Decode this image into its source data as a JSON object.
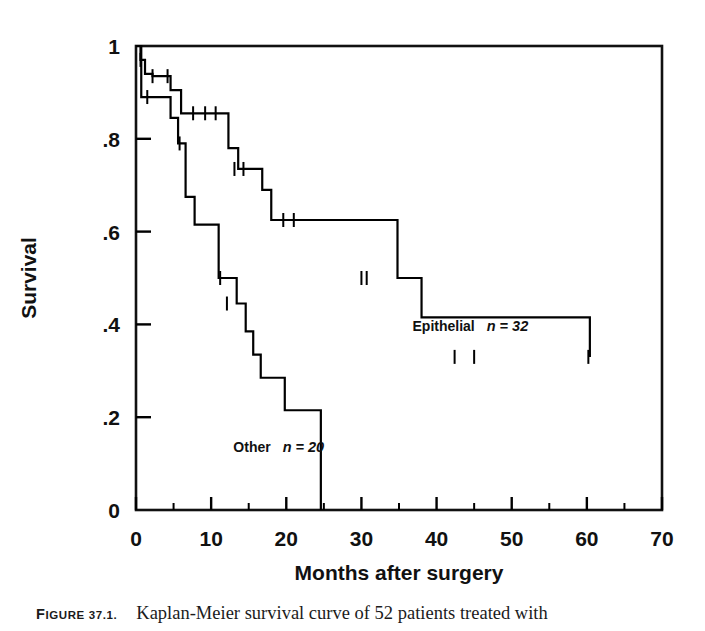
{
  "figure": {
    "caption_label": "FIGURE 37.1.",
    "caption_label_lead": "F",
    "caption_label_rest": "IGURE 37.1.",
    "caption_text": "Kaplan-Meier survival curve of 52 patients treated with"
  },
  "chart_data": {
    "type": "line",
    "title": "",
    "subtitle": "",
    "xlabel": "Months after surgery",
    "ylabel": "Survival",
    "xlim": [
      0,
      70
    ],
    "ylim": [
      0,
      1
    ],
    "grid": false,
    "legend_position": "inside-plot",
    "x_ticks": [
      0,
      10,
      20,
      30,
      40,
      50,
      60,
      70
    ],
    "x_tick_labels": [
      "0",
      "10",
      "20",
      "30",
      "40",
      "50",
      "60",
      "70"
    ],
    "x_minor_ticks": [
      5,
      15,
      25,
      35,
      45,
      55,
      65
    ],
    "y_ticks": [
      0,
      0.2,
      0.4,
      0.6,
      0.8,
      1
    ],
    "y_tick_labels": [
      "0",
      ".2",
      ".4",
      ".6",
      ".8",
      "1"
    ],
    "line_color": "#000000",
    "series": [
      {
        "name": "Epithelial",
        "n_label": "n = 32",
        "n_value": 32,
        "annotation": "Epithelial  n = 32",
        "annotation_x": 44.5,
        "annotation_y": 0.385,
        "step": "post",
        "x": [
          0,
          0.6,
          1.2,
          2.2,
          3.2,
          4.6,
          6.0,
          8.6,
          10.8,
          12.3,
          13.6,
          15.4,
          16.8,
          18.0,
          24.2,
          34.8,
          38.0,
          60.4
        ],
        "y": [
          1.0,
          0.97,
          0.94,
          0.935,
          0.935,
          0.905,
          0.855,
          0.855,
          0.855,
          0.78,
          0.735,
          0.735,
          0.69,
          0.625,
          0.625,
          0.5,
          0.415,
          0.33
        ],
        "censor_x": [
          0.6,
          2.2,
          4.2,
          7.6,
          9.2,
          10.6,
          13.1,
          14.3,
          19.6,
          21.0,
          30.0,
          30.7,
          42.4,
          45.0,
          60.2
        ],
        "censor_y": [
          0.97,
          0.935,
          0.935,
          0.855,
          0.855,
          0.855,
          0.735,
          0.735,
          0.625,
          0.625,
          0.5,
          0.5,
          0.33,
          0.33,
          0.33
        ]
      },
      {
        "name": "Other",
        "n_label": "n = 20",
        "n_value": 20,
        "annotation": "Other  n = 20",
        "annotation_x": 19.0,
        "annotation_y": 0.125,
        "step": "post",
        "x": [
          0,
          0.7,
          3.4,
          4.6,
          5.6,
          6.6,
          7.8,
          11.0,
          13.4,
          14.6,
          15.6,
          16.6,
          19.8,
          24.6
        ],
        "y": [
          1.0,
          0.89,
          0.89,
          0.845,
          0.79,
          0.675,
          0.615,
          0.5,
          0.445,
          0.385,
          0.335,
          0.285,
          0.215,
          0.065
        ],
        "censor_x": [
          1.5,
          5.8,
          11.2,
          12.1
        ],
        "censor_y": [
          0.89,
          0.79,
          0.5,
          0.445
        ],
        "terminal_drop_to_zero": true
      }
    ]
  }
}
